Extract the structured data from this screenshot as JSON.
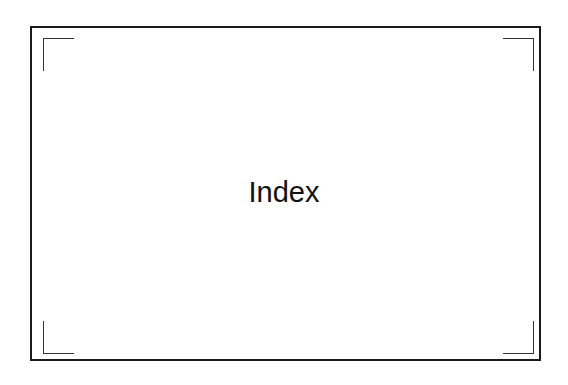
{
  "page": {
    "title": "Index"
  }
}
